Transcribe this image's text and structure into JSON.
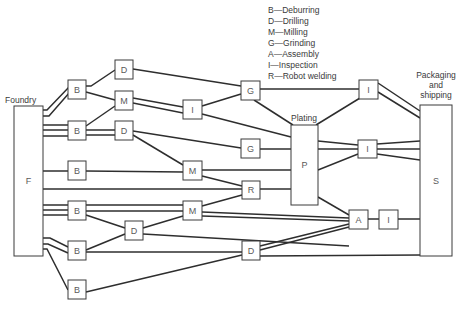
{
  "legend": [
    {
      "code": "B",
      "name": "Deburring",
      "text": "B—Deburring"
    },
    {
      "code": "D",
      "name": "Drilling",
      "text": "D—Drilling"
    },
    {
      "code": "M",
      "name": "Milling",
      "text": "M—Milling"
    },
    {
      "code": "G",
      "name": "Grinding",
      "text": "G—Grinding"
    },
    {
      "code": "A",
      "name": "Assembly",
      "text": "A—Assembly"
    },
    {
      "code": "I",
      "name": "Inspection",
      "text": "I—Inspection"
    },
    {
      "code": "R",
      "name": "Robot welding",
      "text": "R—Robot welding"
    }
  ],
  "captions": {
    "foundry": "Foundry",
    "plating": "Plating",
    "packaging_line1": "Packaging",
    "packaging_line2": "and",
    "packaging_line3": "shipping"
  },
  "nodes": [
    {
      "id": "F",
      "label": "F",
      "x": 14,
      "y": 106,
      "w": 29,
      "h": 150
    },
    {
      "id": "B1",
      "label": "B",
      "x": 68,
      "y": 80,
      "w": 18,
      "h": 19
    },
    {
      "id": "B2",
      "label": "B",
      "x": 68,
      "y": 121,
      "w": 18,
      "h": 19
    },
    {
      "id": "B3",
      "label": "B",
      "x": 68,
      "y": 161,
      "w": 18,
      "h": 19
    },
    {
      "id": "B4",
      "label": "B",
      "x": 68,
      "y": 201,
      "w": 18,
      "h": 19
    },
    {
      "id": "B5",
      "label": "B",
      "x": 68,
      "y": 241,
      "w": 18,
      "h": 19
    },
    {
      "id": "B6",
      "label": "B",
      "x": 68,
      "y": 280,
      "w": 18,
      "h": 19
    },
    {
      "id": "D1",
      "label": "D",
      "x": 115,
      "y": 60,
      "w": 18,
      "h": 19
    },
    {
      "id": "M1",
      "label": "M",
      "x": 115,
      "y": 91,
      "w": 18,
      "h": 19
    },
    {
      "id": "D2",
      "label": "D",
      "x": 115,
      "y": 121,
      "w": 18,
      "h": 19
    },
    {
      "id": "D3",
      "label": "D",
      "x": 125,
      "y": 221,
      "w": 18,
      "h": 19
    },
    {
      "id": "I1",
      "label": "I",
      "x": 183,
      "y": 100,
      "w": 19,
      "h": 19
    },
    {
      "id": "M2",
      "label": "M",
      "x": 183,
      "y": 161,
      "w": 19,
      "h": 19
    },
    {
      "id": "M3",
      "label": "M",
      "x": 183,
      "y": 201,
      "w": 19,
      "h": 19
    },
    {
      "id": "G1",
      "label": "G",
      "x": 241,
      "y": 81,
      "w": 19,
      "h": 19
    },
    {
      "id": "G2",
      "label": "G",
      "x": 241,
      "y": 139,
      "w": 19,
      "h": 19
    },
    {
      "id": "R",
      "label": "R",
      "x": 242,
      "y": 181,
      "w": 18,
      "h": 18
    },
    {
      "id": "D4",
      "label": "D",
      "x": 242,
      "y": 241,
      "w": 18,
      "h": 19
    },
    {
      "id": "P",
      "label": "P",
      "x": 291,
      "y": 125,
      "w": 27,
      "h": 80
    },
    {
      "id": "I2",
      "label": "I",
      "x": 359,
      "y": 80,
      "w": 19,
      "h": 19
    },
    {
      "id": "I3",
      "label": "I",
      "x": 358,
      "y": 140,
      "w": 19,
      "h": 18
    },
    {
      "id": "A",
      "label": "A",
      "x": 349,
      "y": 210,
      "w": 19,
      "h": 19
    },
    {
      "id": "I4",
      "label": "I",
      "x": 379,
      "y": 210,
      "w": 19,
      "h": 19
    },
    {
      "id": "S",
      "label": "S",
      "x": 420,
      "y": 105,
      "w": 32,
      "h": 151
    }
  ],
  "edges": [
    {
      "from": "F",
      "to": "B1",
      "points": [
        [
          43,
          110
        ],
        [
          47,
          110
        ],
        [
          70,
          86
        ]
      ]
    },
    {
      "from": "F",
      "to": "B1",
      "points": [
        [
          43,
          116
        ],
        [
          49,
          116
        ],
        [
          70,
          92
        ]
      ]
    },
    {
      "from": "F",
      "to": "B2",
      "points": [
        [
          43,
          125
        ],
        [
          68,
          125
        ]
      ]
    },
    {
      "from": "F",
      "to": "B2",
      "points": [
        [
          43,
          130
        ],
        [
          68,
          130
        ]
      ]
    },
    {
      "from": "F",
      "to": "B2",
      "points": [
        [
          43,
          136
        ],
        [
          68,
          136
        ]
      ]
    },
    {
      "from": "F",
      "to": "B3",
      "points": [
        [
          43,
          171
        ],
        [
          68,
          171
        ]
      ]
    },
    {
      "from": "F",
      "to": "R",
      "points": [
        [
          43,
          189
        ],
        [
          242,
          189
        ]
      ]
    },
    {
      "from": "F",
      "to": "B4",
      "points": [
        [
          43,
          205
        ],
        [
          68,
          205
        ]
      ]
    },
    {
      "from": "F",
      "to": "B4",
      "points": [
        [
          43,
          210
        ],
        [
          68,
          210
        ]
      ]
    },
    {
      "from": "F",
      "to": "B4",
      "points": [
        [
          43,
          215
        ],
        [
          68,
          215
        ]
      ]
    },
    {
      "from": "F",
      "to": "B5",
      "points": [
        [
          43,
          238
        ],
        [
          50,
          238
        ],
        [
          68,
          247
        ]
      ]
    },
    {
      "from": "F",
      "to": "B5",
      "points": [
        [
          43,
          244
        ],
        [
          48,
          244
        ],
        [
          68,
          253
        ]
      ]
    },
    {
      "from": "F",
      "to": "B6",
      "points": [
        [
          43,
          249
        ],
        [
          47,
          249
        ],
        [
          68,
          290
        ]
      ]
    },
    {
      "from": "B1",
      "to": "D1",
      "points": [
        [
          86,
          86
        ],
        [
          91,
          86
        ],
        [
          115,
          70
        ]
      ]
    },
    {
      "from": "B1",
      "to": "M1",
      "points": [
        [
          86,
          92
        ],
        [
          115,
          100
        ]
      ]
    },
    {
      "from": "B2",
      "to": "M1",
      "points": [
        [
          86,
          126
        ],
        [
          115,
          106
        ]
      ]
    },
    {
      "from": "B2",
      "to": "D2",
      "points": [
        [
          86,
          130
        ],
        [
          115,
          130
        ]
      ]
    },
    {
      "from": "B2",
      "to": "D2",
      "points": [
        [
          86,
          135
        ],
        [
          115,
          135
        ]
      ]
    },
    {
      "from": "D1",
      "to": "G1",
      "points": [
        [
          133,
          69
        ],
        [
          241,
          86
        ]
      ]
    },
    {
      "from": "M1",
      "to": "I1",
      "points": [
        [
          133,
          98
        ],
        [
          183,
          107
        ]
      ]
    },
    {
      "from": "M1",
      "to": "I1",
      "points": [
        [
          133,
          103
        ],
        [
          183,
          113
        ]
      ]
    },
    {
      "from": "D2",
      "to": "G2",
      "points": [
        [
          133,
          131
        ],
        [
          241,
          148
        ]
      ]
    },
    {
      "from": "D2",
      "to": "M2",
      "points": [
        [
          133,
          135
        ],
        [
          183,
          165
        ]
      ]
    },
    {
      "from": "I1",
      "to": "G1",
      "points": [
        [
          202,
          106
        ],
        [
          241,
          94
        ]
      ]
    },
    {
      "from": "I1",
      "to": "P",
      "points": [
        [
          202,
          114
        ],
        [
          291,
          137
        ]
      ]
    },
    {
      "from": "B3",
      "to": "M2",
      "points": [
        [
          86,
          171
        ],
        [
          183,
          172
        ]
      ]
    },
    {
      "from": "B4",
      "to": "M3",
      "points": [
        [
          86,
          205
        ],
        [
          183,
          205
        ]
      ]
    },
    {
      "from": "B4",
      "to": "M3",
      "points": [
        [
          86,
          211
        ],
        [
          183,
          211
        ]
      ]
    },
    {
      "from": "B4",
      "to": "D3",
      "points": [
        [
          86,
          215
        ],
        [
          125,
          228
        ]
      ]
    },
    {
      "from": "B5",
      "to": "D3",
      "points": [
        [
          86,
          250
        ],
        [
          125,
          234
        ]
      ]
    },
    {
      "from": "B5",
      "to": "D4",
      "points": [
        [
          86,
          252
        ],
        [
          242,
          252
        ]
      ]
    },
    {
      "from": "B6",
      "to": "D4",
      "points": [
        [
          86,
          292
        ],
        [
          242,
          255
        ]
      ]
    },
    {
      "from": "D3",
      "to": "M3",
      "points": [
        [
          143,
          228
        ],
        [
          183,
          216
        ]
      ]
    },
    {
      "from": "D3",
      "to": "A",
      "points": [
        [
          143,
          234
        ],
        [
          349,
          246
        ]
      ]
    },
    {
      "from": "M2",
      "to": "P",
      "points": [
        [
          202,
          170
        ],
        [
          291,
          170
        ]
      ]
    },
    {
      "from": "M2",
      "to": "R",
      "points": [
        [
          202,
          176
        ],
        [
          242,
          186
        ]
      ]
    },
    {
      "from": "M3",
      "to": "R",
      "points": [
        [
          202,
          206
        ],
        [
          242,
          195
        ]
      ]
    },
    {
      "from": "M3",
      "to": "A",
      "points": [
        [
          202,
          212
        ],
        [
          349,
          218
        ]
      ]
    },
    {
      "from": "M3",
      "to": "A",
      "points": [
        [
          202,
          216
        ],
        [
          349,
          221
        ]
      ]
    },
    {
      "from": "G1",
      "to": "I2",
      "points": [
        [
          260,
          89
        ],
        [
          359,
          89
        ]
      ]
    },
    {
      "from": "G1",
      "to": "P",
      "points": [
        [
          254,
          100
        ],
        [
          293,
          125
        ]
      ]
    },
    {
      "from": "G2",
      "to": "P",
      "points": [
        [
          260,
          149
        ],
        [
          291,
          149
        ]
      ]
    },
    {
      "from": "R",
      "to": "P",
      "points": [
        [
          260,
          189
        ],
        [
          291,
          189
        ]
      ]
    },
    {
      "from": "D4",
      "to": "A",
      "points": [
        [
          260,
          246
        ],
        [
          349,
          224
        ]
      ]
    },
    {
      "from": "D4",
      "to": "A",
      "points": [
        [
          260,
          250
        ],
        [
          349,
          227
        ]
      ]
    },
    {
      "from": "D4",
      "to": "S",
      "points": [
        [
          260,
          256
        ],
        [
          420,
          255
        ]
      ]
    },
    {
      "from": "P",
      "to": "I2",
      "points": [
        [
          316,
          125
        ],
        [
          360,
          98
        ]
      ]
    },
    {
      "from": "P",
      "to": "I3",
      "points": [
        [
          318,
          141
        ],
        [
          358,
          145
        ]
      ]
    },
    {
      "from": "P",
      "to": "I3",
      "points": [
        [
          318,
          149
        ],
        [
          358,
          149
        ]
      ]
    },
    {
      "from": "P",
      "to": "I3",
      "points": [
        [
          318,
          170
        ],
        [
          358,
          154
        ]
      ]
    },
    {
      "from": "P",
      "to": "A",
      "points": [
        [
          318,
          197
        ],
        [
          349,
          215
        ]
      ]
    },
    {
      "from": "I2",
      "to": "S",
      "points": [
        [
          378,
          83
        ],
        [
          420,
          111
        ]
      ]
    },
    {
      "from": "I2",
      "to": "S",
      "points": [
        [
          378,
          92
        ],
        [
          420,
          118
        ]
      ]
    },
    {
      "from": "I3",
      "to": "S",
      "points": [
        [
          377,
          144
        ],
        [
          420,
          141
        ]
      ]
    },
    {
      "from": "I3",
      "to": "S",
      "points": [
        [
          377,
          149
        ],
        [
          420,
          149
        ]
      ]
    },
    {
      "from": "I3",
      "to": "S",
      "points": [
        [
          377,
          154
        ],
        [
          420,
          160
        ]
      ]
    },
    {
      "from": "A",
      "to": "I4",
      "points": [
        [
          368,
          219
        ],
        [
          379,
          219
        ]
      ]
    },
    {
      "from": "I4",
      "to": "S",
      "points": [
        [
          398,
          219
        ],
        [
          420,
          219
        ]
      ]
    }
  ]
}
